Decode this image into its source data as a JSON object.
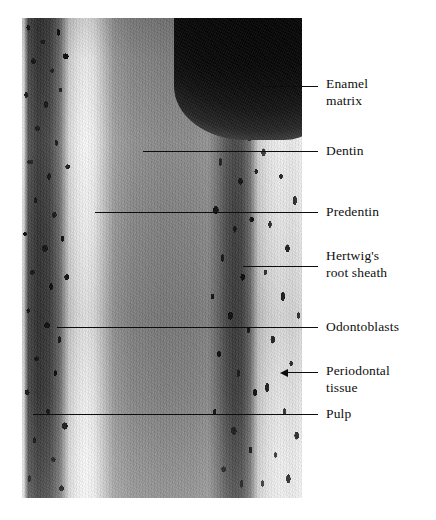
{
  "figure": {
    "kind": "histology-micrograph",
    "stain_appearance": "grayscale halftone",
    "colors": {
      "page_background": "#ffffff",
      "leader_line": "#0d0d0d",
      "label_text": "#0f0f0f",
      "enamel_matrix_tone": "#060606",
      "dentin_tone": "#878787",
      "predentin_tone": "#f4f4f4",
      "odontoblast_tone": "#1a1a1a",
      "periodontal_tone": "#ededed"
    }
  },
  "labels": [
    {
      "id": "enamel-matrix",
      "text": "Enamel\nmatrix",
      "line_start_x": 262,
      "line_end_x": 318,
      "line_y": 86,
      "text_x": 326,
      "text_y": 76,
      "has_arrow": false
    },
    {
      "id": "dentin",
      "text": "Dentin",
      "line_start_x": 143,
      "line_end_x": 318,
      "line_y": 151,
      "text_x": 326,
      "text_y": 143,
      "has_arrow": false
    },
    {
      "id": "predentin",
      "text": "Predentin",
      "line_start_x": 95,
      "line_end_x": 318,
      "line_y": 212,
      "text_x": 326,
      "text_y": 204,
      "has_arrow": false
    },
    {
      "id": "hertwigs-root-sheath",
      "text": "Hertwig's\nroot sheath",
      "line_start_x": 243,
      "line_end_x": 318,
      "line_y": 266,
      "text_x": 326,
      "text_y": 248,
      "has_arrow": false
    },
    {
      "id": "odontoblasts",
      "text": "Odontoblasts",
      "line_start_x": 57,
      "line_end_x": 318,
      "line_y": 327,
      "text_x": 326,
      "text_y": 319,
      "has_arrow": false
    },
    {
      "id": "periodontal-tissue",
      "text": "Periodontal\ntissue",
      "line_start_x": 288,
      "line_end_x": 318,
      "line_y": 372,
      "text_x": 326,
      "text_y": 363,
      "has_arrow": true
    },
    {
      "id": "pulp",
      "text": "Pulp",
      "line_start_x": 33,
      "line_end_x": 318,
      "line_y": 414,
      "text_x": 326,
      "text_y": 406,
      "has_arrow": false
    }
  ]
}
